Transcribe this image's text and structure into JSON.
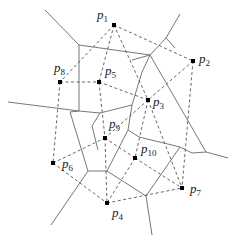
{
  "diagram": {
    "type": "voronoi-delaunay",
    "points": [
      {
        "id": "p1",
        "label": "p",
        "sub": "1",
        "x": 114,
        "y": 25,
        "lx": 97,
        "ly": 19
      },
      {
        "id": "p2",
        "label": "p",
        "sub": "2",
        "x": 193,
        "y": 61,
        "lx": 199,
        "ly": 63
      },
      {
        "id": "p3",
        "label": "p",
        "sub": "3",
        "x": 148,
        "y": 100,
        "lx": 153,
        "ly": 106
      },
      {
        "id": "p4",
        "label": "p",
        "sub": "4",
        "x": 107,
        "y": 203,
        "lx": 112,
        "ly": 217
      },
      {
        "id": "p5",
        "label": "p",
        "sub": "5",
        "x": 99,
        "y": 82,
        "lx": 105,
        "ly": 75
      },
      {
        "id": "p6",
        "label": "p",
        "sub": "6",
        "x": 53,
        "y": 163,
        "lx": 62,
        "ly": 168
      },
      {
        "id": "p7",
        "label": "p",
        "sub": "7",
        "x": 182,
        "y": 188,
        "lx": 190,
        "ly": 193
      },
      {
        "id": "p8",
        "label": "p",
        "sub": "8",
        "x": 60,
        "y": 82,
        "lx": 54,
        "ly": 72
      },
      {
        "id": "p9",
        "label": "p",
        "sub": "9",
        "x": 105,
        "y": 138,
        "lx": 109,
        "ly": 128
      },
      {
        "id": "p10",
        "label": "p",
        "sub": "10",
        "x": 135,
        "y": 158,
        "lx": 141,
        "ly": 153
      }
    ],
    "delaunay_edges": [
      [
        "p1",
        "p2"
      ],
      [
        "p1",
        "p8"
      ],
      [
        "p1",
        "p5"
      ],
      [
        "p1",
        "p3"
      ],
      [
        "p2",
        "p3"
      ],
      [
        "p2",
        "p7"
      ],
      [
        "p8",
        "p5"
      ],
      [
        "p8",
        "p6"
      ],
      [
        "p5",
        "p3"
      ],
      [
        "p5",
        "p9"
      ],
      [
        "p3",
        "p9"
      ],
      [
        "p3",
        "p10"
      ],
      [
        "p3",
        "p7"
      ],
      [
        "p6",
        "p9"
      ],
      [
        "p6",
        "p4"
      ],
      [
        "p9",
        "p10"
      ],
      [
        "p9",
        "p4"
      ],
      [
        "p10",
        "p7"
      ],
      [
        "p10",
        "p4"
      ],
      [
        "p4",
        "p7"
      ]
    ],
    "voronoi_edges": [
      [
        45,
        10,
        79,
        45
      ],
      [
        79,
        45,
        79,
        111
      ],
      [
        79,
        45,
        150,
        55
      ],
      [
        150,
        55,
        166,
        38
      ],
      [
        166,
        38,
        180,
        14
      ],
      [
        150,
        55,
        132,
        60
      ],
      [
        166,
        38,
        175,
        48
      ],
      [
        150,
        55,
        142,
        72
      ],
      [
        142,
        72,
        132,
        105
      ],
      [
        150,
        55,
        206,
        152
      ],
      [
        206,
        152,
        228,
        158
      ],
      [
        206,
        152,
        192,
        153
      ],
      [
        79,
        111,
        8,
        102
      ],
      [
        79,
        111,
        70,
        112
      ],
      [
        79,
        111,
        100,
        113
      ],
      [
        100,
        113,
        132,
        105
      ],
      [
        70,
        112,
        88,
        171
      ],
      [
        132,
        105,
        128,
        130
      ],
      [
        128,
        130,
        139,
        137
      ],
      [
        100,
        113,
        92,
        126
      ],
      [
        92,
        126,
        98,
        150
      ],
      [
        88,
        171,
        51,
        225
      ],
      [
        88,
        171,
        107,
        171
      ],
      [
        107,
        171,
        128,
        130
      ],
      [
        107,
        171,
        146,
        196
      ],
      [
        146,
        196,
        152,
        235
      ],
      [
        146,
        196,
        180,
        147
      ],
      [
        180,
        147,
        192,
        153
      ],
      [
        139,
        137,
        180,
        147
      ]
    ]
  }
}
